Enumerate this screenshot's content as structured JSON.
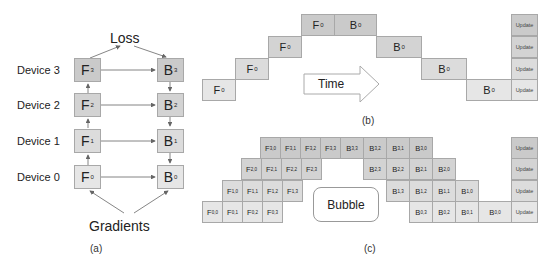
{
  "panel_a": {
    "caption": "(a)",
    "top_label": "Loss",
    "bottom_label": "Gradients",
    "devices": [
      {
        "label": "Device 3",
        "forward": "F",
        "forward_sub": "3",
        "backward": "B",
        "backward_sub": "3"
      },
      {
        "label": "Device 2",
        "forward": "F",
        "forward_sub": "2",
        "backward": "B",
        "backward_sub": "2"
      },
      {
        "label": "Device 1",
        "forward": "F",
        "forward_sub": "1",
        "backward": "B",
        "backward_sub": "1"
      },
      {
        "label": "Device 0",
        "forward": "F",
        "forward_sub": "0",
        "backward": "B",
        "backward_sub": "0"
      }
    ]
  },
  "panel_b": {
    "caption": "(b)",
    "arrow_label": "Time",
    "forward": [
      {
        "text": "F",
        "sub": "0"
      },
      {
        "text": "F",
        "sub": "0"
      },
      {
        "text": "F",
        "sub": "0"
      },
      {
        "text": "F",
        "sub": "0"
      }
    ],
    "backward": [
      {
        "text": "B",
        "sub": "0"
      },
      {
        "text": "B",
        "sub": "0"
      },
      {
        "text": "B",
        "sub": "0"
      },
      {
        "text": "B",
        "sub": "0"
      }
    ],
    "update_label": "Update"
  },
  "panel_c": {
    "caption": "(c)",
    "bubble_label": "Bubble",
    "update_label": "Update",
    "rows": [
      {
        "forward": [
          "3,0",
          "3,1",
          "3,2",
          "3,3"
        ],
        "backward": [
          "3,3",
          "3,2",
          "3,1",
          "3,0"
        ]
      },
      {
        "forward": [
          "2,0",
          "2,1",
          "2,2",
          "2,3"
        ],
        "backward": [
          "2,3",
          "2,2",
          "2,1",
          "2,0"
        ]
      },
      {
        "forward": [
          "1,0",
          "1,1",
          "1,2",
          "1,3"
        ],
        "backward": [
          "1,3",
          "1,2",
          "1,1",
          "1,0"
        ]
      },
      {
        "forward": [
          "0,0",
          "0,1",
          "0,2",
          "0,3"
        ],
        "backward": [
          "0,3",
          "0,2",
          "0,1",
          "0,0"
        ]
      }
    ]
  }
}
